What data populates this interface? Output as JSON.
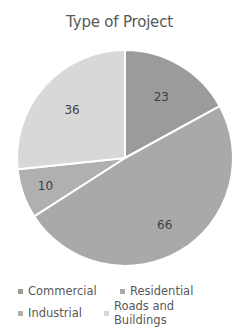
{
  "chart_data": {
    "type": "pie",
    "title": "Type of Project",
    "categories": [
      "Commercial",
      "Residential",
      "Industrial",
      "Roads and Buildings"
    ],
    "values": [
      23,
      66,
      10,
      36
    ],
    "colors": [
      "#9b9b9b",
      "#a9a9a9",
      "#b0b0b0",
      "#d8d8d8"
    ],
    "data_labels": [
      "23",
      "66",
      "10",
      "36"
    ],
    "legend_position": "bottom",
    "start_angle": 0,
    "direction": "clockwise"
  },
  "legend": {
    "items": [
      {
        "label": "Commercial",
        "color": "#9b9b9b"
      },
      {
        "label": "Residential",
        "color": "#a9a9a9"
      },
      {
        "label": "Industrial",
        "color": "#b0b0b0"
      },
      {
        "label": "Roads and Buildings",
        "color": "#d8d8d8"
      }
    ]
  }
}
